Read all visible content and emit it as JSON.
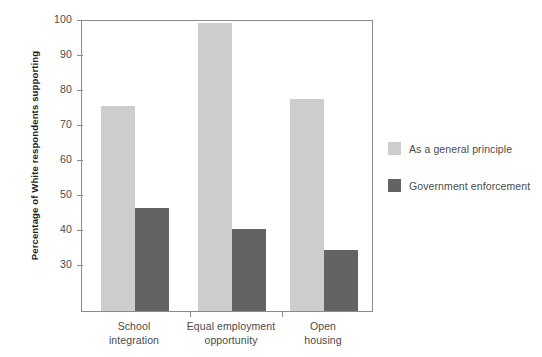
{
  "chart_data": {
    "type": "bar",
    "title": "",
    "xlabel": "",
    "ylabel": "Percentage of White respondents supporting",
    "categories": [
      "School\nintegration",
      "Equal employment\nopportunity",
      "Open\nhousing"
    ],
    "category_lines": [
      [
        "School",
        "integration"
      ],
      [
        "Equal employment",
        "opportunity"
      ],
      [
        "Open",
        "housing"
      ]
    ],
    "series": [
      {
        "name": "As a general principle",
        "color": "#cdcdcd",
        "values": [
          75,
          99,
          77
        ]
      },
      {
        "name": "Government enforcement",
        "color": "#636363",
        "values": [
          46,
          40,
          34
        ]
      }
    ],
    "ylim": [
      16.5,
      100
    ],
    "yticks": [
      30,
      40,
      50,
      60,
      70,
      80,
      90,
      100
    ],
    "ytick_labels": [
      "30",
      "40",
      "50",
      "60",
      "70",
      "80",
      "90",
      "100"
    ],
    "grid": false,
    "legend_position": "right",
    "axis_color": "#8a8a8a",
    "background": "#ffffff"
  },
  "legend": {
    "items": [
      {
        "label": "As a general principle",
        "color": "#cdcdcd"
      },
      {
        "label": "Government enforcement",
        "color": "#636363"
      }
    ]
  }
}
